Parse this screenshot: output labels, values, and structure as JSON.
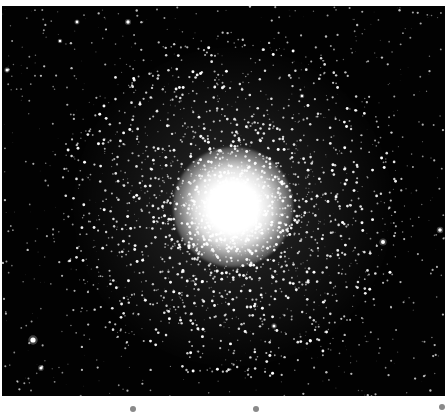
{
  "image": {
    "subject": "globular star cluster",
    "background_color": "#020202",
    "star_color": "#ffffff",
    "cluster_center": [
      231,
      201
    ],
    "core_radius": 30,
    "halo_radius": 110,
    "field_star_count": 900,
    "cluster_star_count": 2600,
    "seed": 4242,
    "bright_stars": [
      [
        31,
        334,
        2.6
      ],
      [
        381,
        236,
        2.0
      ],
      [
        438,
        224,
        1.8
      ],
      [
        126,
        16,
        1.7
      ],
      [
        39,
        362,
        1.6
      ],
      [
        5,
        64,
        1.5
      ],
      [
        75,
        16,
        1.4
      ],
      [
        58,
        35,
        1.3
      ],
      [
        272,
        320,
        1.5
      ],
      [
        300,
        90,
        1.3
      ]
    ]
  },
  "markers": [
    {
      "x": 130,
      "y": 406
    },
    {
      "x": 253,
      "y": 406
    },
    {
      "x": 439,
      "y": 404
    }
  ]
}
